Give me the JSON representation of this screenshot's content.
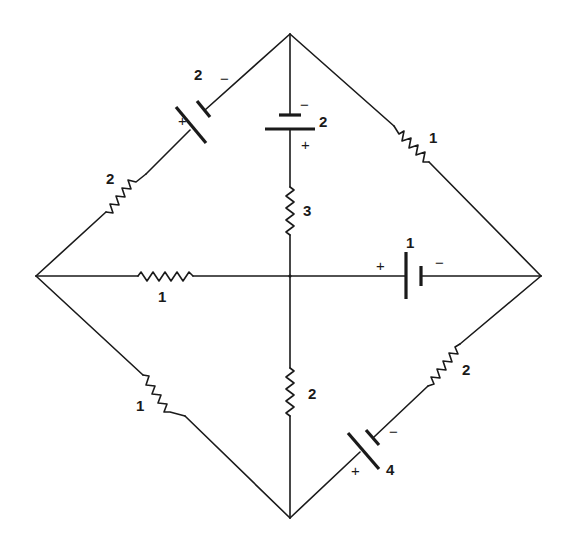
{
  "diagram": {
    "type": "circuit",
    "colors": {
      "line": "#1a1a1a",
      "background": "#ffffff"
    },
    "nodes": [
      {
        "id": "top",
        "x": 290,
        "y": 34
      },
      {
        "id": "left",
        "x": 36,
        "y": 276
      },
      {
        "id": "right",
        "x": 541,
        "y": 276
      },
      {
        "id": "bottom",
        "x": 290,
        "y": 518
      },
      {
        "id": "center",
        "x": 290,
        "y": 276
      }
    ],
    "components": [
      {
        "id": "battery-top-left",
        "type": "battery",
        "value": "2",
        "branch": "left-top",
        "plus": "+",
        "minus": "−"
      },
      {
        "id": "resistor-top-left",
        "type": "resistor",
        "value": "2",
        "branch": "left-top"
      },
      {
        "id": "battery-top-center",
        "type": "battery",
        "value": "2",
        "branch": "top-center",
        "plus": "+",
        "minus": "−"
      },
      {
        "id": "resistor-top-center",
        "type": "resistor",
        "value": "3",
        "branch": "top-center"
      },
      {
        "id": "resistor-top-right",
        "type": "resistor",
        "value": "1",
        "branch": "top-right"
      },
      {
        "id": "resistor-left-center",
        "type": "resistor",
        "value": "1",
        "branch": "left-center"
      },
      {
        "id": "battery-center-right",
        "type": "battery",
        "value": "1",
        "branch": "center-right",
        "plus": "+",
        "minus": "−"
      },
      {
        "id": "resistor-left-bottom",
        "type": "resistor",
        "value": "1",
        "branch": "left-bottom"
      },
      {
        "id": "resistor-center-bottom",
        "type": "resistor",
        "value": "2",
        "branch": "center-bottom"
      },
      {
        "id": "resistor-bottom-right",
        "type": "resistor",
        "value": "2",
        "branch": "bottom-right"
      },
      {
        "id": "battery-bottom-right",
        "type": "battery",
        "value": "4",
        "branch": "bottom-right",
        "plus": "+",
        "minus": "−"
      }
    ]
  },
  "labels": {
    "bat_tl": "2",
    "bat_tl_minus": "−",
    "bat_tl_plus": "+",
    "res_tl": "2",
    "bat_tc": "2",
    "bat_tc_minus": "−",
    "bat_tc_plus": "+",
    "res_tc": "3",
    "res_tr": "1",
    "res_lc": "1",
    "bat_cr": "1",
    "bat_cr_plus": "+",
    "bat_cr_minus": "−",
    "res_lb": "1",
    "res_cb": "2",
    "res_br": "2",
    "bat_br": "4",
    "bat_br_minus": "−",
    "bat_br_plus": "+"
  }
}
